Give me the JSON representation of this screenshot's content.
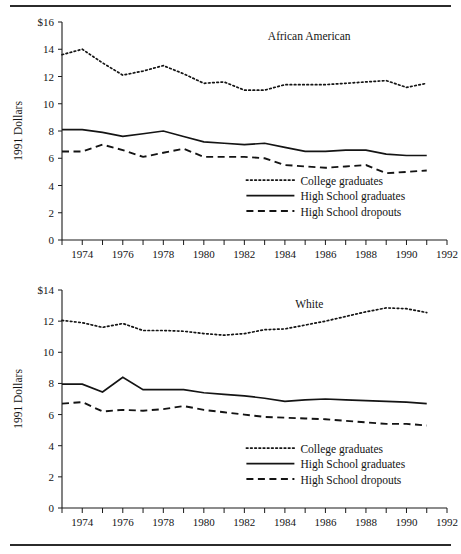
{
  "figure": {
    "rule_color": "#2b2b2b",
    "ink_color": "#141414",
    "y_axis_title": "1991 Dollars"
  },
  "chart_data": [
    {
      "type": "line",
      "title": "African American",
      "xlabel": "",
      "ylabel": "1991 Dollars",
      "xlim": [
        1973,
        1992
      ],
      "ylim": [
        0,
        16
      ],
      "grid": false,
      "legend_position": "inside lower right",
      "y_ticks": [
        0,
        2,
        4,
        6,
        8,
        10,
        12,
        14,
        16
      ],
      "y_ticklabels": [
        "0",
        "2",
        "4",
        "6",
        "8",
        "10",
        "12",
        "14",
        "$16"
      ],
      "x_ticks": [
        1973,
        1974,
        1975,
        1976,
        1977,
        1978,
        1979,
        1980,
        1981,
        1982,
        1983,
        1984,
        1985,
        1986,
        1987,
        1988,
        1989,
        1990,
        1991,
        1992
      ],
      "x_ticklabels": [
        "",
        "1974",
        "",
        "1976",
        "",
        "1978",
        "",
        "1980",
        "",
        "1982",
        "",
        "1984",
        "",
        "1986",
        "",
        "1988",
        "",
        "1990",
        "",
        "1992"
      ],
      "x": [
        1973,
        1974,
        1975,
        1976,
        1977,
        1978,
        1979,
        1980,
        1981,
        1982,
        1983,
        1984,
        1985,
        1986,
        1987,
        1988,
        1989,
        1990,
        1991
      ],
      "series": [
        {
          "name": "College graduates",
          "style": "dotted",
          "values": [
            13.6,
            14.0,
            13.0,
            12.1,
            12.4,
            12.8,
            12.2,
            11.5,
            11.6,
            11.0,
            11.0,
            11.4,
            11.4,
            11.4,
            11.5,
            11.6,
            11.7,
            11.2,
            11.5
          ]
        },
        {
          "name": "High School graduates",
          "style": "solid",
          "values": [
            8.1,
            8.1,
            7.9,
            7.6,
            7.8,
            8.0,
            7.6,
            7.2,
            7.1,
            7.0,
            7.1,
            6.8,
            6.5,
            6.5,
            6.6,
            6.6,
            6.3,
            6.2,
            6.2
          ]
        },
        {
          "name": "High School dropouts",
          "style": "dashed",
          "values": [
            6.5,
            6.5,
            7.0,
            6.6,
            6.1,
            6.4,
            6.7,
            6.1,
            6.1,
            6.1,
            6.0,
            5.5,
            5.4,
            5.3,
            5.4,
            5.5,
            4.9,
            5.0,
            5.1
          ]
        }
      ]
    },
    {
      "type": "line",
      "title": "White",
      "xlabel": "",
      "ylabel": "1991 Dollars",
      "xlim": [
        1973,
        1992
      ],
      "ylim": [
        0,
        14
      ],
      "grid": false,
      "legend_position": "inside lower right",
      "y_ticks": [
        0,
        2,
        4,
        6,
        8,
        10,
        12,
        14
      ],
      "y_ticklabels": [
        "0",
        "2",
        "4",
        "6",
        "8",
        "10",
        "12",
        "$14"
      ],
      "x_ticks": [
        1973,
        1974,
        1975,
        1976,
        1977,
        1978,
        1979,
        1980,
        1981,
        1982,
        1983,
        1984,
        1985,
        1986,
        1987,
        1988,
        1989,
        1990,
        1991,
        1992
      ],
      "x_ticklabels": [
        "",
        "1974",
        "",
        "1976",
        "",
        "1978",
        "",
        "1980",
        "",
        "1982",
        "",
        "1984",
        "",
        "1986",
        "",
        "1988",
        "",
        "1990",
        "",
        "1992"
      ],
      "x": [
        1973,
        1974,
        1975,
        1976,
        1977,
        1978,
        1979,
        1980,
        1981,
        1982,
        1983,
        1984,
        1985,
        1986,
        1987,
        1988,
        1989,
        1990,
        1991
      ],
      "series": [
        {
          "name": "College graduates",
          "style": "dotted",
          "values": [
            12.05,
            11.9,
            11.6,
            11.85,
            11.4,
            11.4,
            11.35,
            11.2,
            11.1,
            11.2,
            11.45,
            11.5,
            11.75,
            12.0,
            12.3,
            12.6,
            12.85,
            12.8,
            12.55
          ]
        },
        {
          "name": "High School graduates",
          "style": "solid",
          "values": [
            7.95,
            7.95,
            7.45,
            8.4,
            7.6,
            7.6,
            7.6,
            7.4,
            7.3,
            7.2,
            7.05,
            6.85,
            6.95,
            7.0,
            6.95,
            6.9,
            6.85,
            6.8,
            6.7
          ]
        },
        {
          "name": "High School dropouts",
          "style": "dashed",
          "values": [
            6.7,
            6.8,
            6.2,
            6.3,
            6.25,
            6.35,
            6.55,
            6.3,
            6.15,
            6.0,
            5.85,
            5.8,
            5.75,
            5.7,
            5.6,
            5.5,
            5.4,
            5.4,
            5.3
          ]
        }
      ]
    }
  ]
}
